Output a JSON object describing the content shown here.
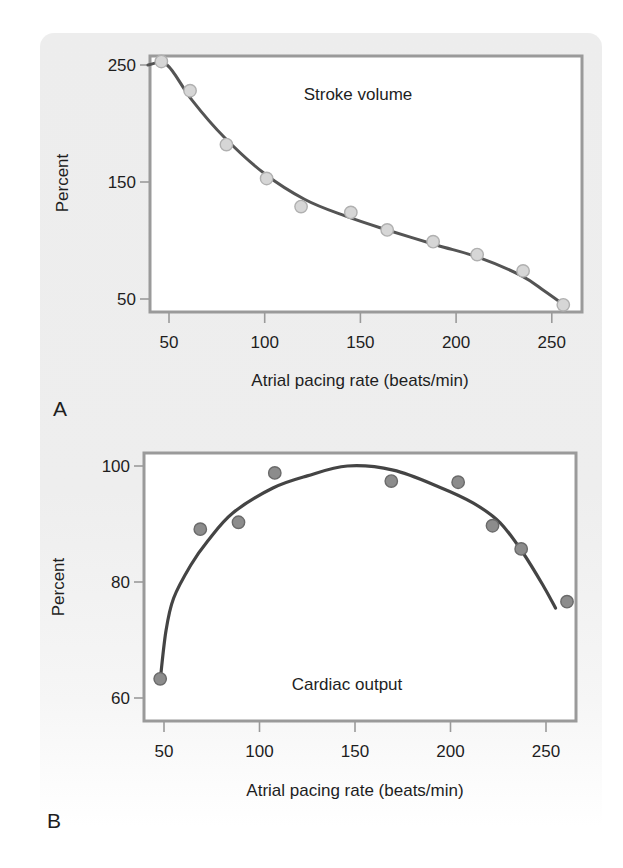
{
  "figure": {
    "panels": [
      {
        "letter": "A",
        "inner_label": "Stroke volume",
        "xlabel": "Atrial pacing rate (beats/min)",
        "ylabel": "Percent",
        "colors": {
          "frame": "#9a9a9a",
          "curve": "#545454",
          "point_fill": "#d6d6d6",
          "point_stroke": "#b0b0b0"
        }
      },
      {
        "letter": "B",
        "inner_label": "Cardiac output",
        "xlabel": "Atrial pacing rate (beats/min)",
        "ylabel": "Percent",
        "colors": {
          "frame": "#9a9a9a",
          "curve": "#444444",
          "point_fill": "#8c8c8c",
          "point_stroke": "#6a6a6a"
        }
      }
    ]
  },
  "chart_data": [
    {
      "type": "scatter",
      "title": "Stroke volume",
      "panel": "A",
      "xlabel": "Atrial pacing rate (beats/min)",
      "ylabel": "Percent",
      "xticks": [
        50,
        100,
        150,
        200,
        250
      ],
      "yticks": [
        50,
        150,
        250
      ],
      "xlim": [
        40,
        265
      ],
      "ylim": [
        40,
        260
      ],
      "grid": false,
      "series": [
        {
          "name": "Measured",
          "kind": "scatter",
          "x": [
            46,
            61,
            80,
            101,
            119,
            145,
            164,
            188,
            211,
            235,
            256
          ],
          "y": [
            253,
            228,
            182,
            153,
            129,
            124,
            109,
            99,
            88,
            74,
            45
          ]
        },
        {
          "name": "Fitted curve",
          "kind": "line",
          "x": [
            39,
            49,
            62,
            79,
            100,
            121,
            142,
            164,
            190,
            211,
            234,
            246,
            258
          ],
          "y": [
            250,
            250,
            220,
            188,
            157,
            135,
            121,
            109,
            96,
            86,
            70,
            57,
            43
          ]
        }
      ]
    },
    {
      "type": "scatter",
      "title": "Cardiac output",
      "panel": "B",
      "xlabel": "Atrial pacing rate (beats/min)",
      "ylabel": "Percent",
      "xticks": [
        50,
        100,
        150,
        200,
        250
      ],
      "yticks": [
        60,
        80,
        100
      ],
      "xlim": [
        40,
        265
      ],
      "ylim": [
        57,
        102
      ],
      "grid": false,
      "series": [
        {
          "name": "Measured",
          "kind": "scatter",
          "x": [
            48,
            69,
            89,
            108,
            169,
            204,
            222,
            237,
            261
          ],
          "y": [
            63.3,
            89.1,
            90.3,
            98.8,
            97.4,
            97.2,
            89.7,
            85.7,
            76.6
          ]
        },
        {
          "name": "Fitted curve",
          "kind": "line",
          "x": [
            48,
            51,
            55,
            64,
            73,
            86,
            107,
            125,
            146,
            170,
            194,
            212,
            226,
            238,
            249,
            255
          ],
          "y": [
            63,
            71.5,
            77.2,
            82.9,
            87.1,
            91.9,
            96.2,
            98.3,
            100,
            99.3,
            96.4,
            93.6,
            90.2,
            85.0,
            79.1,
            75.5
          ]
        }
      ]
    }
  ]
}
